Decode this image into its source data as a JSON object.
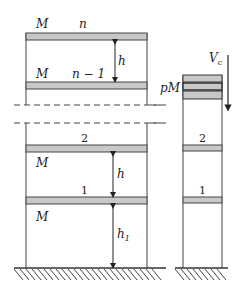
{
  "diagram": {
    "left_frame": {
      "floors": [
        {
          "id": "n",
          "label": "n",
          "mass_label": "M"
        },
        {
          "id": "n-1",
          "label": "n − 1",
          "mass_label": "M"
        },
        {
          "id": "2",
          "label": "2",
          "mass_label": "M"
        },
        {
          "id": "1",
          "label": "1",
          "mass_label": "M"
        }
      ],
      "story_height_label": "h",
      "story_height_label_2": "h",
      "first_story_height_label": "h",
      "first_story_height_subscript": "1"
    },
    "right_column": {
      "mass_label": "pM",
      "floor_labels": [
        "2",
        "1"
      ],
      "load_label": "V",
      "load_subscript": "c"
    },
    "colors": {
      "slab_fill": "#c8c8c8",
      "line": "#333333",
      "background": "#ffffff"
    }
  }
}
